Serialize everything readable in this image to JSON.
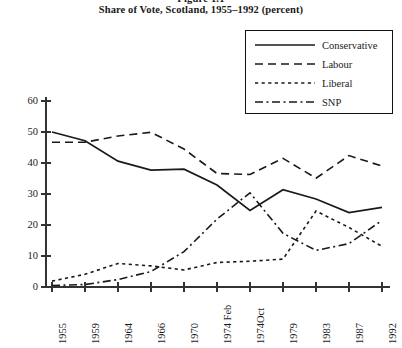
{
  "figure": {
    "number": "Figure 1.1",
    "title": "Share of Vote, Scotland, 1955–1992 (percent)"
  },
  "legend": {
    "position": "top-right",
    "entries": [
      {
        "label": "Conservative",
        "style": "solid",
        "color": "#1a1a1a"
      },
      {
        "label": "Labour",
        "style": "dashed",
        "color": "#1a1a1a"
      },
      {
        "label": "Liberal",
        "style": "dotted",
        "color": "#1a1a1a"
      },
      {
        "label": "SNP",
        "style": "dashdot",
        "color": "#1a1a1a"
      }
    ]
  },
  "axes": {
    "y_ticks": [
      "0",
      "10",
      "20",
      "30",
      "40",
      "50",
      "60"
    ],
    "x_ticks": [
      "1955",
      "1959",
      "1964",
      "1966",
      "1970",
      "1974 Feb",
      "1974Oct",
      "1979",
      "1983",
      "1987",
      "1992"
    ]
  },
  "chart_data": {
    "type": "line",
    "title": "Share of Vote, Scotland, 1955–1992 (percent)",
    "subtitle": "Figure 1.1",
    "xlabel": "",
    "ylabel": "",
    "ylim": [
      0,
      60
    ],
    "grid": false,
    "legend_position": "top-right",
    "categories": [
      "1955",
      "1959",
      "1964",
      "1966",
      "1970",
      "1974 Feb",
      "1974Oct",
      "1979",
      "1983",
      "1987",
      "1992"
    ],
    "series": [
      {
        "name": "Conservative",
        "style": "solid",
        "values": [
          50.0,
          47.2,
          40.6,
          37.7,
          38.0,
          32.9,
          24.7,
          31.4,
          28.4,
          24.0,
          25.7
        ]
      },
      {
        "name": "Labour",
        "style": "dashed",
        "values": [
          46.7,
          46.7,
          48.7,
          49.9,
          44.5,
          36.6,
          36.3,
          41.5,
          35.1,
          42.4,
          39.0
        ]
      },
      {
        "name": "Liberal",
        "style": "dotted",
        "values": [
          1.9,
          4.1,
          7.6,
          6.8,
          5.5,
          7.9,
          8.3,
          9.0,
          24.5,
          19.2,
          13.1
        ]
      },
      {
        "name": "SNP",
        "style": "dashdot",
        "values": [
          0.5,
          0.8,
          2.4,
          5.0,
          11.4,
          21.9,
          30.4,
          17.3,
          11.8,
          14.0,
          21.5
        ]
      }
    ]
  }
}
